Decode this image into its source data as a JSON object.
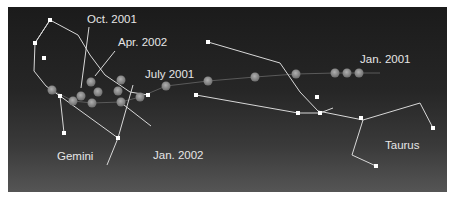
{
  "diagram": {
    "title": "",
    "colors": {
      "sky_top": "#1b1b1b",
      "sky_bottom": "#555555",
      "lines": "#d8d8d8",
      "stars": "#ffffff",
      "planet": "#8a8a8a",
      "text": "#e6e6e6"
    },
    "constellations": [
      {
        "name": "Gemini",
        "label_pos": [
          57,
          157
        ]
      },
      {
        "name": "Taurus",
        "label_pos": [
          385,
          140
        ]
      }
    ],
    "date_labels": [
      {
        "text": "Oct. 2001",
        "pos": [
          87,
          14
        ]
      },
      {
        "text": "Apr. 2002",
        "pos": [
          118,
          37
        ]
      },
      {
        "text": "July 2001",
        "pos": [
          145,
          69
        ]
      },
      {
        "text": "Jan. 2002",
        "pos": [
          153,
          150
        ]
      },
      {
        "text": "Jan. 2001",
        "pos": [
          360,
          54
        ]
      }
    ],
    "planet_path_description": "Retrograde path of a planet from Jan. 2001 to Apr. 2002 moving westward from Taurus into Gemini"
  }
}
